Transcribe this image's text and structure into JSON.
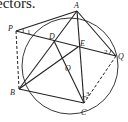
{
  "caption": "ectors.",
  "diagram": {
    "circle": {
      "cx": 70,
      "cy": 66,
      "r": 48
    },
    "points": {
      "A": {
        "label": "A",
        "x": 77,
        "y": 11
      },
      "P": {
        "label": "P",
        "x": 16,
        "y": 31
      },
      "D": {
        "label": "D",
        "x": 54,
        "y": 41
      },
      "E": {
        "label": "E",
        "x": 78,
        "y": 47
      },
      "Q": {
        "label": "Q",
        "x": 116,
        "y": 56
      },
      "O": {
        "label": "O",
        "x": 64,
        "y": 61
      },
      "B": {
        "label": "B",
        "x": 19,
        "y": 89
      },
      "C": {
        "label": "C",
        "x": 84,
        "y": 103
      }
    },
    "angle_labels": {
      "one": "1",
      "two": "2",
      "three": "3"
    },
    "line_color": "#222222"
  }
}
